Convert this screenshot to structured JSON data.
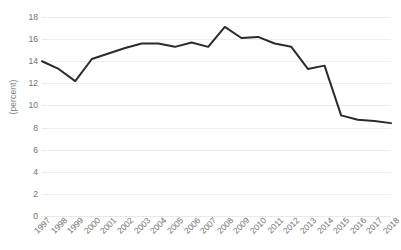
{
  "chart_data": {
    "type": "line",
    "title": "",
    "xlabel": "",
    "ylabel": "(percent)",
    "ylim": [
      0,
      18
    ],
    "ytick_step": 2,
    "yticks": [
      18,
      16,
      14,
      12,
      10,
      8,
      6,
      4,
      2,
      0
    ],
    "grid": "horizontal",
    "legend": "none",
    "line_color": "#2b2b2b",
    "gridline_color": "#efeeec",
    "tick_label_color": "#6f6f6f",
    "axis_title_color": "#7f7f7f",
    "categories": [
      "1997",
      "1998",
      "1999",
      "2000",
      "2001",
      "2002",
      "2003",
      "2004",
      "2005",
      "2006",
      "2007",
      "2008",
      "2009",
      "2010",
      "2011",
      "2012",
      "2013",
      "2014",
      "2015",
      "2016",
      "2017",
      "2018"
    ],
    "values": [
      14.0,
      13.3,
      12.2,
      14.2,
      14.7,
      15.2,
      15.6,
      15.6,
      15.3,
      15.7,
      15.3,
      17.1,
      16.1,
      16.2,
      15.6,
      15.3,
      13.3,
      13.6,
      9.1,
      8.7,
      8.6,
      8.4
    ],
    "series": [
      {
        "name": "percent",
        "values": [
          14.0,
          13.3,
          12.2,
          14.2,
          14.7,
          15.2,
          15.6,
          15.6,
          15.3,
          15.7,
          15.3,
          17.1,
          16.1,
          16.2,
          15.6,
          15.3,
          13.3,
          13.6,
          9.1,
          8.7,
          8.6,
          8.4
        ]
      }
    ]
  }
}
